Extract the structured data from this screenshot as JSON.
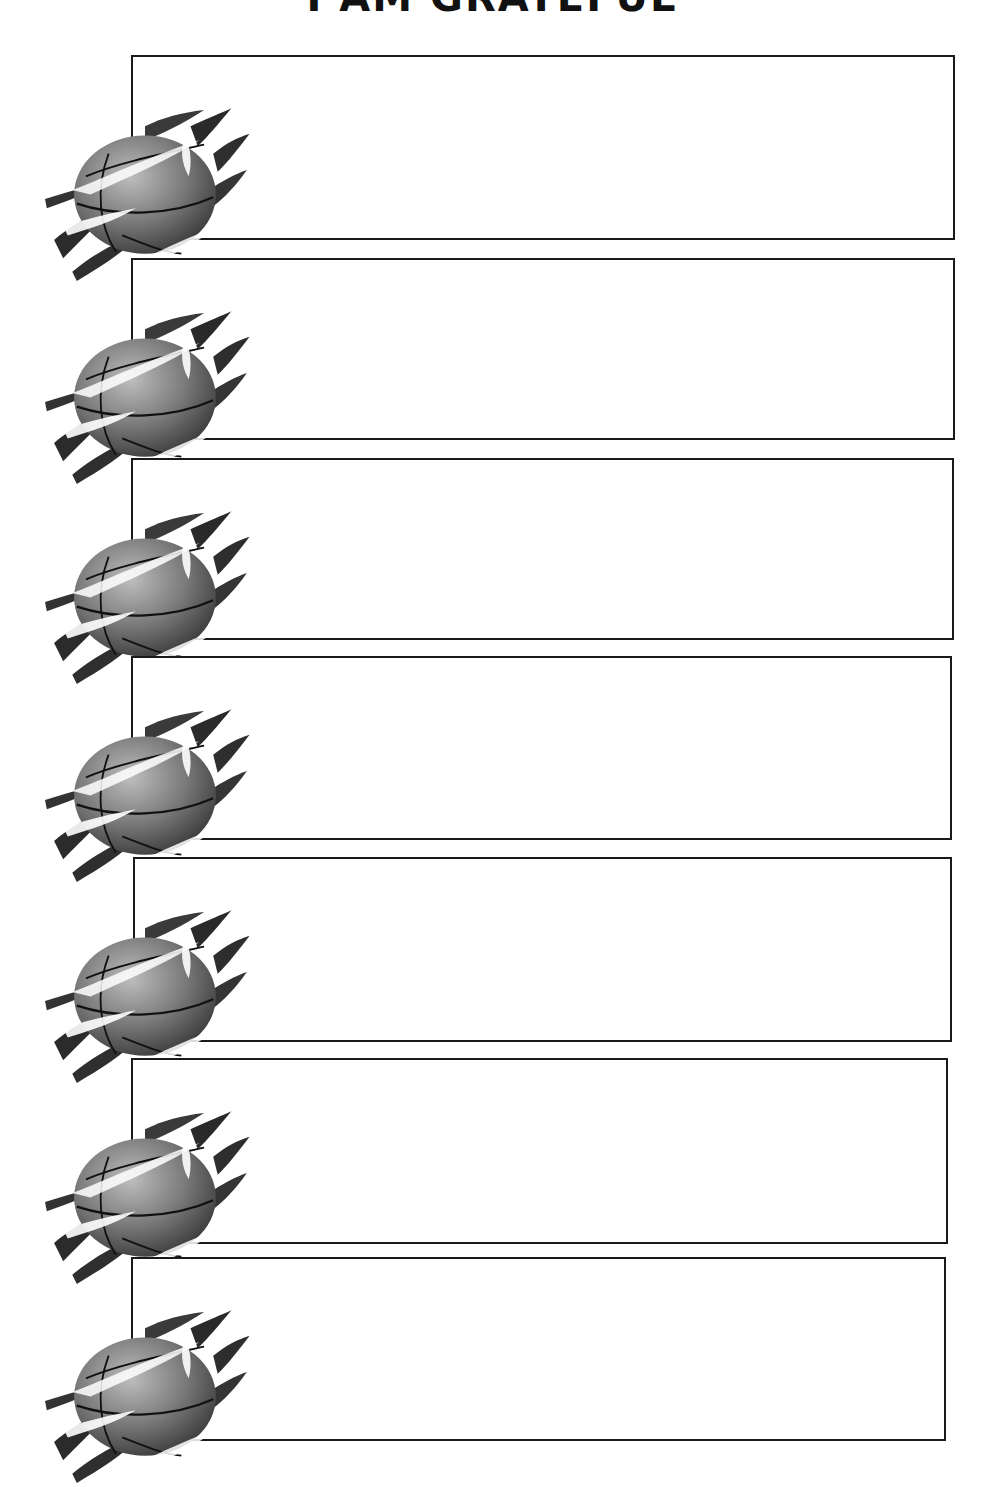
{
  "title": "I AM GRATEFUL",
  "boxes": [
    {
      "index": 1,
      "text": "",
      "icon": "flaming-basketball-icon"
    },
    {
      "index": 2,
      "text": "",
      "icon": "flaming-basketball-icon"
    },
    {
      "index": 3,
      "text": "",
      "icon": "flaming-basketball-icon"
    },
    {
      "index": 4,
      "text": "",
      "icon": "flaming-basketball-icon"
    },
    {
      "index": 5,
      "text": "",
      "icon": "flaming-basketball-icon"
    },
    {
      "index": 6,
      "text": "",
      "icon": "flaming-basketball-icon"
    },
    {
      "index": 7,
      "text": "",
      "icon": "flaming-basketball-icon"
    }
  ]
}
